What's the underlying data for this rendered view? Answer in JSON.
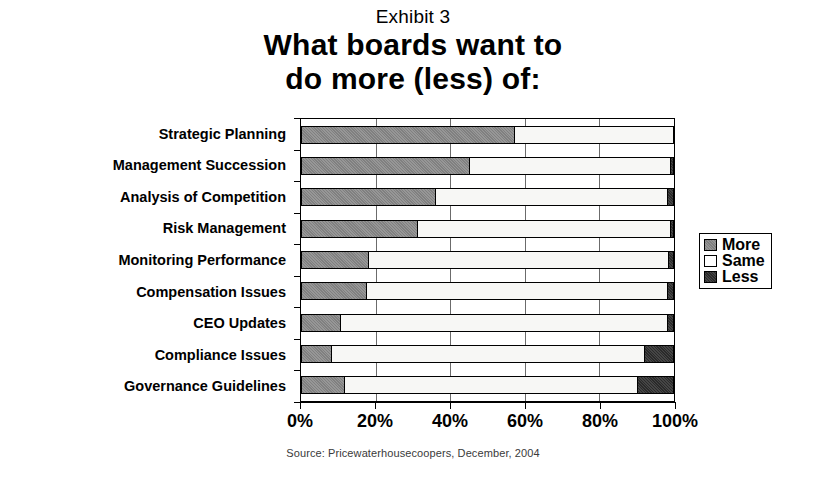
{
  "exhibit_label": "Exhibit 3",
  "title_lines": [
    "What boards want to",
    "do more (less) of:"
  ],
  "source_note": "Source: Pricewaterhousecoopers, December, 2004",
  "legend": {
    "items": [
      {
        "label": "More",
        "color": "#808080"
      },
      {
        "label": "Same",
        "color": "#ffffff"
      },
      {
        "label": "Less",
        "color": "#2a2a2a"
      }
    ]
  },
  "axis": {
    "x_ticks": [
      "0%",
      "20%",
      "40%",
      "60%",
      "80%",
      "100%"
    ],
    "x_tick_values": [
      0,
      20,
      40,
      60,
      80,
      100
    ]
  },
  "chart_data": {
    "type": "bar",
    "orientation": "horizontal",
    "stacked": true,
    "title": "What boards want to do more (less) of:",
    "subtitle": "Exhibit 3",
    "xlabel": "",
    "ylabel": "",
    "xlim": [
      0,
      100
    ],
    "grid": true,
    "legend_position": "right",
    "annotations": [
      "Source: Pricewaterhousecoopers, December, 2004"
    ],
    "categories": [
      "Strategic Planning",
      "Management Succession",
      "Analysis of Competition",
      "Risk Management",
      "Monitoring Performance",
      "Compensation Issues",
      "CEO Updates",
      "Compliance Issues",
      "Governance Guidelines"
    ],
    "series": [
      {
        "name": "More",
        "color": "#808080",
        "values": [
          57,
          45,
          36,
          31,
          18,
          17.5,
          10.5,
          8,
          11.5
        ]
      },
      {
        "name": "Same",
        "color": "#ffffff",
        "values": [
          43,
          54,
          62,
          68,
          80.5,
          80.5,
          87.5,
          84,
          78.5
        ]
      },
      {
        "name": "Less",
        "color": "#2a2a2a",
        "values": [
          0,
          1,
          2,
          1,
          1.5,
          2,
          2,
          8,
          10
        ]
      }
    ]
  }
}
